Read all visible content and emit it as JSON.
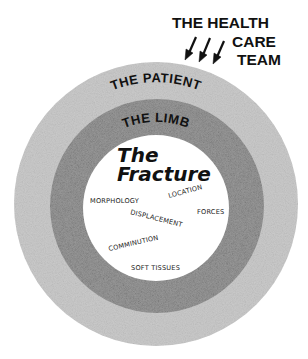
{
  "diagram": {
    "header": {
      "line1": "THE HEALTH",
      "line2": "CARE",
      "line3": "TEAM",
      "arrows": [
        "arrow-down-icon",
        "arrow-down-icon",
        "arrow-down-icon"
      ]
    },
    "rings": {
      "outer": {
        "label": "THE PATIENT",
        "color": "#c9c9c9"
      },
      "middle": {
        "label": "THE LIMB",
        "color": "#8f8f8f"
      },
      "inner": {
        "title_line1": "The",
        "title_line2": "Fracture",
        "color": "#ffffff"
      }
    },
    "factors": {
      "morphology": "MORPHOLOGY",
      "location": "LOCATION",
      "forces": "FORCES",
      "displacement": "DISPLACEMENT",
      "comminution": "COMMINUTION",
      "soft_tissues": "SOFT TISSUES"
    }
  }
}
